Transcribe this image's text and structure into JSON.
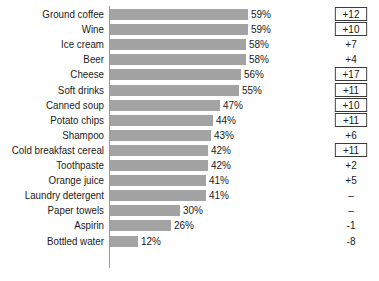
{
  "chart_data": {
    "type": "bar",
    "orientation": "horizontal",
    "title": "",
    "subtitle": "",
    "xlabel": "",
    "ylabel": "",
    "xlim": [
      0,
      59
    ],
    "grid": false,
    "legend": null,
    "value_suffix": "%",
    "categories": [
      "Ground coffee",
      "Wine",
      "Ice cream",
      "Beer",
      "Cheese",
      "Soft drinks",
      "Canned soup",
      "Potato chips",
      "Shampoo",
      "Cold breakfast cereal",
      "Toothpaste",
      "Orange juice",
      "Laundry detergent",
      "Paper towels",
      "Aspirin",
      "Bottled water"
    ],
    "values": [
      59,
      59,
      58,
      58,
      56,
      55,
      47,
      44,
      43,
      42,
      42,
      41,
      41,
      30,
      26,
      12
    ],
    "value_labels": [
      "59%",
      "59%",
      "58%",
      "58%",
      "56%",
      "55%",
      "47%",
      "44%",
      "43%",
      "42%",
      "42%",
      "41%",
      "41%",
      "30%",
      "26%",
      "12%"
    ],
    "series": [
      {
        "name": "percent",
        "values": [
          59,
          59,
          58,
          58,
          56,
          55,
          47,
          44,
          43,
          42,
          42,
          41,
          41,
          30,
          26,
          12
        ]
      },
      {
        "name": "change",
        "labels": [
          "+12",
          "+10",
          "+7",
          "+4",
          "+17",
          "+11",
          "+10",
          "+11",
          "+6",
          "+11",
          "+2",
          "+5",
          "–",
          "–",
          "-1",
          "-8"
        ],
        "values": [
          12,
          10,
          7,
          4,
          17,
          11,
          10,
          11,
          6,
          11,
          2,
          5,
          null,
          null,
          -1,
          -8
        ],
        "boxed": [
          true,
          true,
          false,
          false,
          true,
          true,
          true,
          true,
          false,
          true,
          false,
          false,
          false,
          false,
          false,
          false
        ]
      }
    ],
    "bar_color": "#a3a3a3",
    "axis_color": "#9a9a9a",
    "text_color": "#1a1a1a",
    "box_color": "#3a3a3a"
  }
}
